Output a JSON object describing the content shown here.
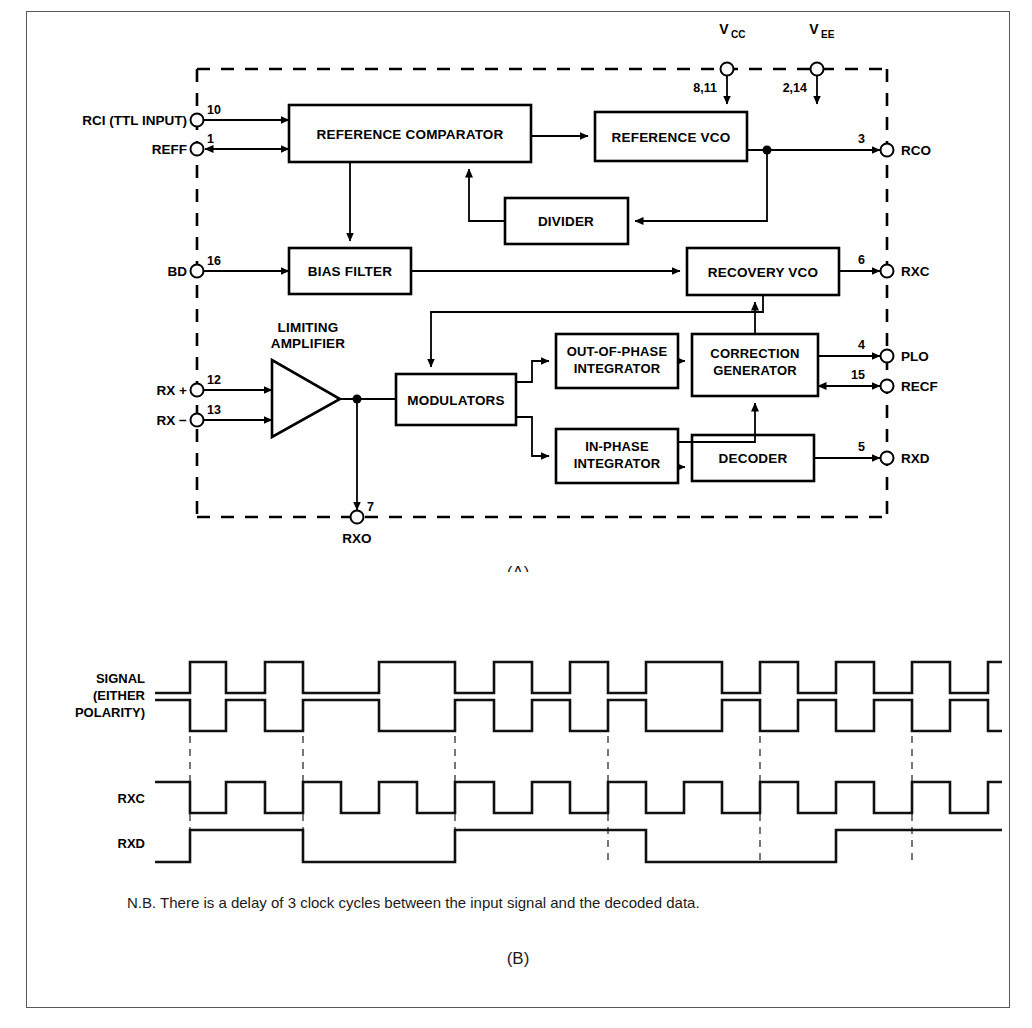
{
  "figure": {
    "part_a_label": "(A)",
    "part_b_label": "(B)",
    "note": "N.B. There is a delay of 3 clock cycles between the input signal and the decoded data."
  },
  "block_diagram": {
    "blocks": [
      {
        "id": "reference-comparator",
        "label": "REFERENCE COMPARATOR"
      },
      {
        "id": "reference-vco",
        "label": "REFERENCE VCO"
      },
      {
        "id": "divider",
        "label": "DIVIDER"
      },
      {
        "id": "bias-filter",
        "label": "BIAS FILTER"
      },
      {
        "id": "recovery-vco",
        "label": "RECOVERY VCO"
      },
      {
        "id": "modulators",
        "label": "MODULATORS"
      },
      {
        "id": "out-of-phase-integrator",
        "line1": "OUT-OF-PHASE",
        "line2": "INTEGRATOR"
      },
      {
        "id": "in-phase-integrator",
        "line1": "IN-PHASE",
        "line2": "INTEGRATOR"
      },
      {
        "id": "correction-generator",
        "line1": "CORRECTION",
        "line2": "GENERATOR"
      },
      {
        "id": "decoder",
        "label": "DECODER"
      }
    ],
    "amplifier": {
      "line1": "LIMITING",
      "line2": "AMPLIFIER"
    },
    "pins_left": [
      {
        "name": "RCI (TTL INPUT)",
        "number": "10",
        "direction": "in"
      },
      {
        "name": "REFF",
        "number": "1",
        "direction": "bidirectional"
      },
      {
        "name": "BD",
        "number": "16",
        "direction": "in"
      },
      {
        "name": "RX +",
        "number": "12",
        "direction": "in"
      },
      {
        "name": "RX −",
        "number": "13",
        "direction": "in"
      }
    ],
    "pins_right": [
      {
        "name": "RCO",
        "number": "3",
        "direction": "out"
      },
      {
        "name": "RXC",
        "number": "6",
        "direction": "out"
      },
      {
        "name": "PLO",
        "number": "4",
        "direction": "out"
      },
      {
        "name": "RECF",
        "number": "15",
        "direction": "bidirectional"
      },
      {
        "name": "RXD",
        "number": "5",
        "direction": "out"
      }
    ],
    "pins_bottom": [
      {
        "name": "RXO",
        "number": "7",
        "direction": "out"
      }
    ],
    "supplies": [
      {
        "name": "V",
        "subscript": "CC",
        "pins": "8,11"
      },
      {
        "name": "V",
        "subscript": "EE",
        "pins": "2,14"
      }
    ]
  },
  "chart_data": {
    "type": "line",
    "xlabel": "",
    "ylabel": "",
    "grid": false,
    "legend": "none",
    "traces": [
      {
        "name": "SIGNAL (EITHER POLARITY)",
        "label_lines": [
          "SIGNAL",
          "(EITHER",
          "POLARITY)"
        ],
        "polarity": "true",
        "description": "Manchester-encoded input signal, upper trace",
        "transitions_px": [
          163,
          199,
          238,
          276,
          352,
          428,
          467,
          505,
          543,
          581,
          619,
          695,
          733,
          771,
          809,
          847,
          885,
          923,
          961
        ],
        "start_level": "low"
      },
      {
        "name": "SIGNAL (EITHER POLARITY) inverted",
        "polarity": "false",
        "description": "Complement of the upper signal trace",
        "transitions_px": [
          163,
          199,
          238,
          276,
          352,
          428,
          467,
          505,
          543,
          581,
          619,
          695,
          733,
          771,
          809,
          847,
          885,
          923,
          961
        ],
        "start_level": "high"
      },
      {
        "name": "RXC",
        "description": "Recovered clock output",
        "transitions_px": [
          163,
          199,
          238,
          276,
          314,
          352,
          390,
          428,
          467,
          505,
          543,
          581,
          619,
          657,
          695,
          733,
          771,
          809,
          847,
          885,
          923,
          961
        ],
        "start_level": "high"
      },
      {
        "name": "RXD",
        "description": "Decoded data output, delayed by 3 clock cycles",
        "transitions_px": [
          163,
          276,
          428,
          619,
          809
        ],
        "start_level": "low"
      }
    ],
    "alignment_marks_px": [
      163,
      276,
      428,
      581,
      733,
      885
    ],
    "x_range_px": [
      128,
      975
    ]
  }
}
